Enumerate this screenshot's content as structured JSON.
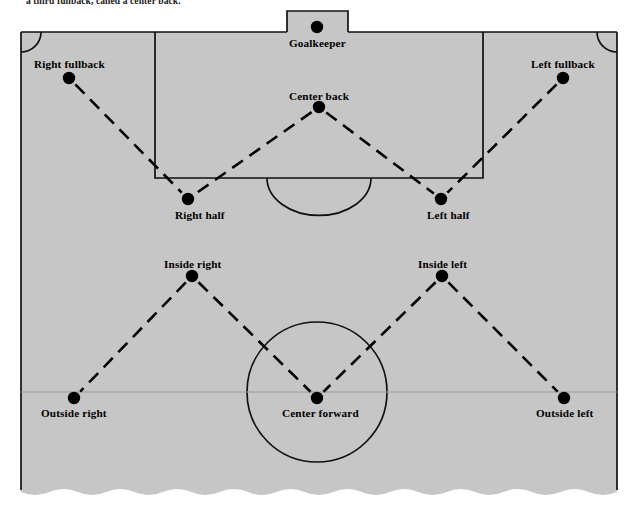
{
  "caption": "a third fullback, called a center back.",
  "diagram": {
    "field_color": "#c6c6c6",
    "line_color": "#111111",
    "dot_color": "#000000",
    "orientation": "defense-at-top",
    "formation": "2-3-5 (pyramid) with center back"
  },
  "players": [
    {
      "id": "goalkeeper",
      "label": "Goalkeeper",
      "x": 317,
      "y": 27,
      "label_x": 317,
      "label_y": 44,
      "label_align": "center"
    },
    {
      "id": "center-back",
      "label": "Center back",
      "x": 319,
      "y": 107,
      "label_x": 319,
      "label_y": 97,
      "label_align": "center"
    },
    {
      "id": "right-fullback",
      "label": "Right fullback",
      "x": 69,
      "y": 78,
      "label_x": 69,
      "label_y": 65,
      "label_align": "center"
    },
    {
      "id": "left-fullback",
      "label": "Left fullback",
      "x": 563,
      "y": 78,
      "label_x": 563,
      "label_y": 65,
      "label_align": "center"
    },
    {
      "id": "right-half",
      "label": "Right half",
      "x": 188,
      "y": 199,
      "label_x": 200,
      "label_y": 216,
      "label_align": "center"
    },
    {
      "id": "left-half",
      "label": "Left half",
      "x": 441,
      "y": 199,
      "label_x": 448,
      "label_y": 216,
      "label_align": "center"
    },
    {
      "id": "inside-right",
      "label": "Inside right",
      "x": 192,
      "y": 276,
      "label_x": 192,
      "label_y": 265,
      "label_align": "center"
    },
    {
      "id": "inside-left",
      "label": "Inside left",
      "x": 442,
      "y": 276,
      "label_x": 442,
      "label_y": 265,
      "label_align": "center"
    },
    {
      "id": "outside-right",
      "label": "Outside right",
      "x": 74,
      "y": 398,
      "label_x": 74,
      "label_y": 414,
      "label_align": "center"
    },
    {
      "id": "center-forward",
      "label": "Center forward",
      "x": 317,
      "y": 398,
      "label_x": 320,
      "label_y": 414,
      "label_align": "center"
    },
    {
      "id": "outside-left",
      "label": "Outside left",
      "x": 564,
      "y": 398,
      "label_x": 564,
      "label_y": 414,
      "label_align": "center"
    }
  ],
  "connections": [
    {
      "from": "right-fullback",
      "to": "right-half"
    },
    {
      "from": "center-back",
      "to": "right-half"
    },
    {
      "from": "center-back",
      "to": "left-half"
    },
    {
      "from": "left-fullback",
      "to": "left-half"
    },
    {
      "from": "inside-right",
      "to": "outside-right"
    },
    {
      "from": "inside-right",
      "to": "center-forward"
    },
    {
      "from": "inside-left",
      "to": "center-forward"
    },
    {
      "from": "inside-left",
      "to": "outside-left"
    }
  ],
  "field_markings": {
    "touchline_left_x": 21,
    "touchline_right_x": 617,
    "goal_line_y": 32,
    "penalty_area": {
      "x": 155,
      "y": 32,
      "width": 328,
      "height": 146
    },
    "goal_box": {
      "x": 287,
      "y": 11,
      "width": 61,
      "height": 21
    },
    "penalty_arc": {
      "cx": 319,
      "cy": 178,
      "r": 52
    },
    "center_circle": {
      "cx": 317,
      "cy": 392,
      "r": 70
    },
    "halfway_line_y": 392,
    "corner_arc_radius": 20,
    "bottom_edge": "torn-wavy"
  }
}
